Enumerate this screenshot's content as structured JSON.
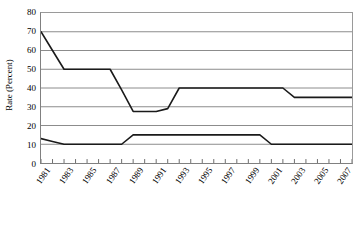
{
  "chart_data": {
    "type": "line",
    "title": "",
    "xlabel": "",
    "ylabel": "Rate (Percent)",
    "ylim": [
      0,
      80
    ],
    "ytick_step": 10,
    "yticks": [
      "0",
      "10",
      "20",
      "30",
      "40",
      "50",
      "60",
      "70",
      "80"
    ],
    "xlim": [
      1981,
      2008
    ],
    "xticks": [
      "1981",
      "1983",
      "1985",
      "1987",
      "1989",
      "1991",
      "1993",
      "1995",
      "1997",
      "1999",
      "2001",
      "2003",
      "2005",
      "2007"
    ],
    "grid": true,
    "grid_axis": "y",
    "legend": "none",
    "x": [
      1981,
      1982,
      1983,
      1984,
      1985,
      1986,
      1987,
      1988,
      1989,
      1990,
      1991,
      1992,
      1993,
      1994,
      1995,
      1996,
      1997,
      1998,
      1999,
      2000,
      2001,
      2002,
      2003,
      2004,
      2005,
      2006,
      2007,
      2008
    ],
    "series": [
      {
        "name": "upper-rate-series",
        "color": "#1a1a1a",
        "values": [
          70,
          60,
          50,
          50,
          50,
          50,
          50,
          39,
          27.5,
          27.5,
          27.5,
          29,
          40,
          40,
          40,
          40,
          40,
          40,
          40,
          40,
          40,
          40,
          35,
          35,
          35,
          35,
          35,
          35
        ]
      },
      {
        "name": "lower-rate-series",
        "color": "#1a1a1a",
        "values": [
          13,
          11.5,
          10,
          10,
          10,
          10,
          10,
          10,
          15,
          15,
          15,
          15,
          15,
          15,
          15,
          15,
          15,
          15,
          15,
          15,
          10,
          10,
          10,
          10,
          10,
          10,
          10,
          10
        ]
      }
    ]
  },
  "axes": {
    "y_axis_title": "Rate (Percent)"
  }
}
